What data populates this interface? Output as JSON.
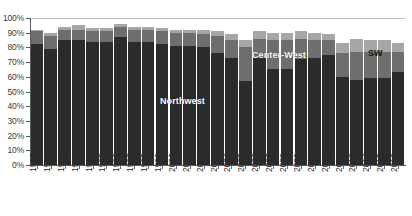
{
  "chart": {
    "type": "bar",
    "title": "",
    "xlabel": "",
    "ylabel": ""
  },
  "axis": {
    "y_ticks": [
      "100%",
      "90%",
      "80%",
      "70%",
      "60%",
      "50%",
      "40%",
      "30%",
      "20%",
      "10%",
      "0%"
    ],
    "y_min": 0,
    "y_max": 100,
    "grid": true
  },
  "annotations": {
    "northwest": "Northwest",
    "center_west": "Center-West",
    "sw": "SW"
  },
  "colors": {
    "northwest": "#2b2b2b",
    "center_west": "#6e6e6e",
    "sw": "#a6a6a6",
    "top": "#8c8c8c",
    "grid": "#bfbfbf",
    "axis": "#5a5a5a",
    "background": "#ffffff"
  },
  "chart_data": {
    "type": "bar",
    "stacked": true,
    "title": "",
    "xlabel": "",
    "ylabel": "",
    "ylim": [
      0,
      100
    ],
    "grid": true,
    "legend_position": "in-plot-annotations",
    "categories": [
      "1990",
      "1991",
      "1992",
      "1993",
      "1994",
      "1995",
      "1996",
      "1997",
      "1998",
      "1999",
      "2000",
      "2001",
      "2002",
      "2003",
      "2004",
      "2005",
      "2006",
      "2007",
      "2008",
      "2009",
      "2010",
      "2011",
      "2012",
      "2013",
      "2014",
      "2015",
      "2016"
    ],
    "series": [
      {
        "name": "Northwest",
        "color": "#2b2b2b",
        "values": [
          82,
          79,
          85,
          85,
          84,
          84,
          87,
          84,
          84,
          82,
          81,
          81,
          80,
          76,
          73,
          57,
          73,
          65,
          65,
          72,
          73,
          75,
          60,
          58,
          59,
          59,
          63
        ]
      },
      {
        "name": "Center-West",
        "color": "#6e6e6e",
        "values": [
          9,
          9,
          7,
          7,
          7,
          7,
          7,
          8,
          8,
          9,
          9,
          9,
          9,
          12,
          12,
          23,
          13,
          20,
          20,
          14,
          12,
          10,
          16,
          19,
          18,
          18,
          14
        ]
      },
      {
        "name": "SW",
        "color": "#a6a6a6",
        "values": [
          1,
          2,
          2,
          3,
          2,
          2,
          2,
          2,
          2,
          2,
          2,
          2,
          3,
          3,
          4,
          5,
          5,
          5,
          5,
          5,
          5,
          4,
          7,
          9,
          8,
          8,
          6
        ]
      }
    ],
    "totals": [
      92,
      90,
      94,
      95,
      93,
      93,
      96,
      94,
      94,
      93,
      92,
      92,
      92,
      91,
      89,
      85,
      91,
      90,
      90,
      91,
      90,
      89,
      83,
      86,
      85,
      85,
      83
    ]
  }
}
